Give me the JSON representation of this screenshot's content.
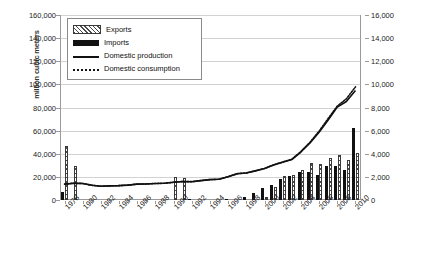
{
  "chart_data": {
    "type": "bar",
    "title": "",
    "xlabel": "",
    "ylabel": "million cubic meters",
    "ylabel_right": "",
    "ylim": [
      0,
      160000
    ],
    "ylim_right": [
      0,
      16000
    ],
    "grid": true,
    "legend_position": "top-left",
    "x": [
      1978,
      1979,
      1980,
      1981,
      1982,
      1983,
      1984,
      1985,
      1986,
      1987,
      1988,
      1989,
      1990,
      1991,
      1992,
      1993,
      1994,
      1995,
      1996,
      1997,
      1998,
      1999,
      2000,
      2001,
      2002,
      2003,
      2004,
      2005,
      2006,
      2007,
      2008,
      2009,
      2010
    ],
    "categories": [
      "1978",
      "1979",
      "1980",
      "1981",
      "1982",
      "1983",
      "1984",
      "1985",
      "1986",
      "1987",
      "1988",
      "1989",
      "1990",
      "1991",
      "1992",
      "1993",
      "1994",
      "1995",
      "1996",
      "1997",
      "1998",
      "1999",
      "2000",
      "2001",
      "2002",
      "2003",
      "2004",
      "2005",
      "2006",
      "2007",
      "2008",
      "2009",
      "2010"
    ],
    "xtick_labels": [
      "1978",
      "1980",
      "1982",
      "1984",
      "1986",
      "1988",
      "1990",
      "1992",
      "1994",
      "1996",
      "1998",
      "2000",
      "2002",
      "2004",
      "2006",
      "2008",
      "2010"
    ],
    "ytick_labels_left": [
      "0",
      "20,000",
      "40,000",
      "60,000",
      "80,000",
      "100,000",
      "120,000",
      "140,000",
      "160,000"
    ],
    "ytick_values_left": [
      0,
      20000,
      40000,
      60000,
      80000,
      100000,
      120000,
      140000,
      160000
    ],
    "ytick_labels_right": [
      "0",
      "2,000",
      "4,000",
      "6,000",
      "8,000",
      "10,000",
      "12,000",
      "14,000",
      "16,000"
    ],
    "ytick_values_right": [
      0,
      2000,
      4000,
      6000,
      8000,
      10000,
      12000,
      14000,
      16000
    ],
    "series": [
      {
        "name": "Exports",
        "axis": "right",
        "kind": "bar",
        "values": [
          4700,
          2900,
          0,
          0,
          0,
          0,
          0,
          0,
          0,
          0,
          0,
          0,
          1950,
          1900,
          0,
          0,
          0,
          0,
          0,
          0,
          0,
          0,
          300,
          1100,
          2100,
          2200,
          2600,
          3200,
          3100,
          3600,
          3900,
          3500,
          4100
        ]
      },
      {
        "name": "Imports",
        "axis": "right",
        "kind": "bar",
        "values": [
          650,
          0,
          0,
          0,
          0,
          0,
          0,
          0,
          0,
          0,
          0,
          0,
          0,
          0,
          60,
          0,
          0,
          0,
          110,
          0,
          300,
          620,
          1000,
          1300,
          1800,
          2100,
          2400,
          2450,
          2200,
          2900,
          2900,
          2600,
          6200
        ]
      },
      {
        "name": "Domestic production",
        "axis": "left",
        "kind": "line",
        "values": [
          13700,
          14500,
          14300,
          12740,
          11930,
          12210,
          12430,
          12900,
          13760,
          13900,
          14260,
          14500,
          15300,
          16000,
          15790,
          16770,
          17600,
          17950,
          20100,
          22700,
          23300,
          25200,
          27200,
          30300,
          32700,
          35000,
          41500,
          49300,
          58550,
          69200,
          80300,
          85200,
          94800
        ]
      },
      {
        "name": "Domestic consumption",
        "axis": "left",
        "kind": "line",
        "values": [
          13700,
          14500,
          14300,
          12740,
          11930,
          12210,
          12430,
          12900,
          13760,
          13900,
          14260,
          14500,
          15300,
          16000,
          15850,
          16800,
          17650,
          18000,
          20200,
          22800,
          23400,
          25300,
          27300,
          30400,
          32900,
          35200,
          42000,
          50000,
          59500,
          70500,
          81200,
          87500,
          97800
        ]
      }
    ],
    "note_scale": "Line series plotted on left axis (0-160,000); bar series plotted on right axis (0-16,000)."
  },
  "legend": {
    "items": [
      {
        "label": "Exports",
        "key": "exports"
      },
      {
        "label": "Imports",
        "key": "imports"
      },
      {
        "label": "Domestic production",
        "key": "production"
      },
      {
        "label": "Domestic consumption",
        "key": "consumption"
      }
    ]
  }
}
